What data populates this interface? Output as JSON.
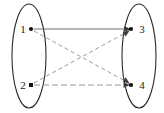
{
  "diagram": {
    "type": "bipartite-directed-graph",
    "canvas": {
      "width": 164,
      "height": 113,
      "background": "#ffffff"
    },
    "groups": [
      {
        "id": "left-set",
        "name": "left-node-set",
        "shape": "ellipse",
        "cx": 29,
        "cy": 56,
        "rx": 17,
        "ry": 52,
        "stroke": "#2b2b2b"
      },
      {
        "id": "right-set",
        "name": "right-node-set",
        "shape": "ellipse",
        "cx": 139,
        "cy": 56,
        "rx": 17,
        "ry": 52,
        "stroke": "#2b2b2b"
      }
    ],
    "nodes": [
      {
        "id": "n1",
        "label": "1",
        "x": 31,
        "y": 29,
        "label_x": 23,
        "label_y": 33,
        "side": "left"
      },
      {
        "id": "n2",
        "label": "2",
        "x": 31,
        "y": 85,
        "label_x": 23,
        "label_y": 89,
        "side": "left"
      },
      {
        "id": "n3",
        "label": "3",
        "x": 131,
        "y": 29,
        "label_x": 142,
        "label_y": 33,
        "side": "right"
      },
      {
        "id": "n4",
        "label": "4",
        "x": 131,
        "y": 85,
        "label_x": 142,
        "label_y": 89,
        "side": "right"
      }
    ],
    "edges": [
      {
        "id": "e13",
        "from": "n1",
        "to": "n3",
        "style": "solid",
        "stroke": "#6e6e6e",
        "arrow": true
      },
      {
        "id": "e24",
        "from": "n2",
        "to": "n4",
        "style": "dashdot",
        "stroke": "#8c8c8c",
        "arrow": true
      },
      {
        "id": "e14",
        "from": "n1",
        "to": "n4",
        "style": "dashed",
        "stroke": "#8c8c8c",
        "arrow": true
      },
      {
        "id": "e23",
        "from": "n2",
        "to": "n3",
        "style": "dashed",
        "stroke": "#8c8c8c",
        "arrow": true
      }
    ]
  }
}
